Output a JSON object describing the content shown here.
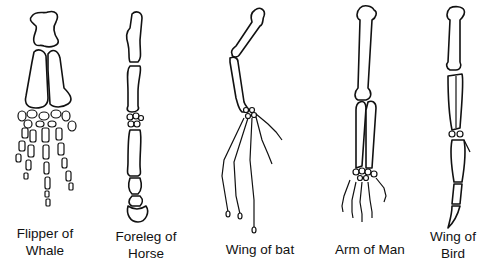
{
  "specimens": [
    {
      "id": "whale",
      "line1": "Flipper of",
      "line2": "Whale"
    },
    {
      "id": "horse",
      "line1": "Foreleg of",
      "line2": "Horse"
    },
    {
      "id": "bat",
      "line1": "Wing of bat",
      "line2": ""
    },
    {
      "id": "man",
      "line1": "Arm of Man",
      "line2": ""
    },
    {
      "id": "bird",
      "line1": "Wing of",
      "line2": "Bird"
    }
  ],
  "colors": {
    "ink": "#111111",
    "background": "#ffffff"
  }
}
